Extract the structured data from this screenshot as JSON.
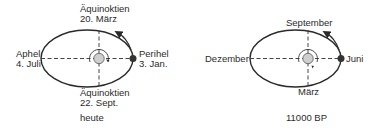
{
  "diagrams": [
    {
      "id": "today",
      "caption": "heute",
      "labels": {
        "top_line1": "Äquinoktien",
        "top_line2": "20. März",
        "bottom_line1": "Äquinoktien",
        "bottom_line2": "22. Sept.",
        "left_line1": "Aphel",
        "left_line2": "4. Juli",
        "right_line1": "Perihel",
        "right_line2": "3. Jan."
      }
    },
    {
      "id": "11000bp",
      "caption": "11000 BP",
      "labels": {
        "top": "September",
        "bottom": "März",
        "left": "Dezember",
        "right": "Juni"
      }
    }
  ],
  "colors": {
    "orbit": "#2a2a2a",
    "sun_fill": "#cfcfcf",
    "earth_fill": "#333333",
    "text": "#2b2b2b"
  }
}
